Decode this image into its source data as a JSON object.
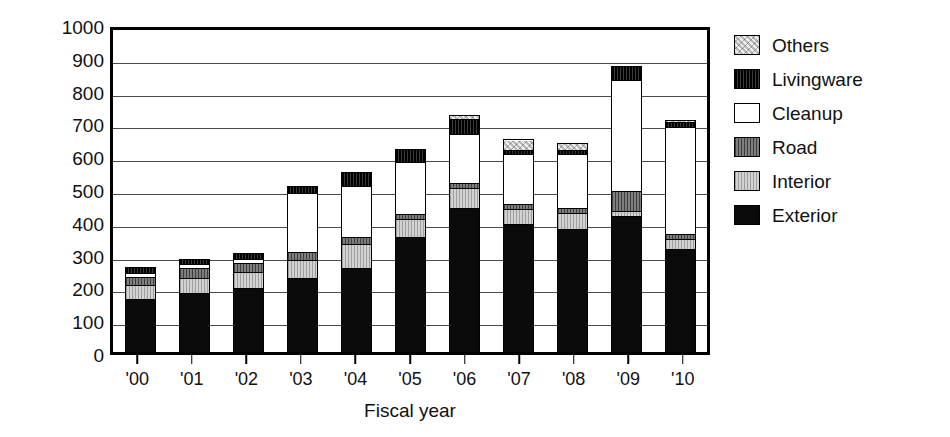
{
  "chart_data": {
    "type": "bar",
    "stacked": true,
    "title": "",
    "xlabel": "Fiscal year",
    "ylabel": "100 million yen",
    "ylim": [
      0,
      1000
    ],
    "ytick_step": 100,
    "yticks": [
      1000,
      900,
      800,
      700,
      600,
      500,
      400,
      300,
      200,
      100,
      0
    ],
    "grid": true,
    "grid_axis": "y",
    "legend_position": "right",
    "categories": [
      "'00",
      "'01",
      "'02",
      "'03",
      "'04",
      "'05",
      "'06",
      "'07",
      "'08",
      "'09",
      "'10"
    ],
    "series": [
      {
        "name": "Exterior",
        "color": "#0b0b0b",
        "values": [
          163,
          180,
          195,
          225,
          255,
          350,
          440,
          390,
          375,
          415,
          315
        ]
      },
      {
        "name": "Interior",
        "color": "#c8c8c8",
        "values": [
          42,
          45,
          50,
          55,
          75,
          55,
          60,
          45,
          50,
          15,
          30
        ]
      },
      {
        "name": "Road",
        "color": "#6e6e6e",
        "values": [
          25,
          30,
          25,
          25,
          20,
          15,
          15,
          15,
          15,
          60,
          15
        ]
      },
      {
        "name": "Cleanup",
        "color": "#ffffff",
        "values": [
          10,
          12,
          15,
          180,
          155,
          160,
          150,
          155,
          165,
          340,
          325
        ]
      },
      {
        "name": "Livingware",
        "color": "#151515",
        "values": [
          15,
          13,
          13,
          18,
          40,
          35,
          45,
          10,
          10,
          40,
          15
        ]
      },
      {
        "name": "Others",
        "color": "#cfcfcf",
        "values": [
          0,
          0,
          0,
          0,
          0,
          0,
          10,
          30,
          20,
          0,
          5
        ]
      }
    ],
    "totals": [
      255,
      280,
      298,
      503,
      545,
      615,
      720,
      645,
      635,
      870,
      705
    ],
    "legend_order": [
      "Others",
      "Livingware",
      "Cleanup",
      "Road",
      "Interior",
      "Exterior"
    ]
  },
  "legend": {
    "items": [
      {
        "label": "Others",
        "key": "others"
      },
      {
        "label": "Livingware",
        "key": "livingware"
      },
      {
        "label": "Cleanup",
        "key": "cleanup"
      },
      {
        "label": "Road",
        "key": "road"
      },
      {
        "label": "Interior",
        "key": "interior"
      },
      {
        "label": "Exterior",
        "key": "exterior"
      }
    ]
  },
  "axes": {
    "y_title": "100 million yen",
    "x_title": "Fiscal year"
  }
}
